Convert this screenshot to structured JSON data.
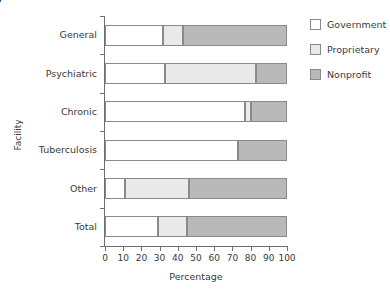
{
  "corner_fragment": {
    "line1": "7",
    "line2": ")"
  },
  "chart_data": {
    "type": "bar",
    "orientation": "horizontal",
    "stacked": true,
    "title": "",
    "xlabel": "Percentage",
    "ylabel": "Facility",
    "xlim": [
      0,
      100
    ],
    "xticks": [
      0,
      10,
      20,
      30,
      40,
      50,
      60,
      70,
      80,
      90,
      100
    ],
    "xticklabels": [
      "0",
      "10",
      "20",
      "30",
      "40",
      "50",
      "60",
      "70",
      "80",
      "90",
      "100"
    ],
    "grid": false,
    "legend_position": "right",
    "categories": [
      "General",
      "Psychiatric",
      "Chronic",
      "Tuberculosis",
      "Other",
      "Total"
    ],
    "series": [
      {
        "name": "Government",
        "color": "#ffffff",
        "values": [
          32,
          33,
          77,
          73,
          11,
          29
        ]
      },
      {
        "name": "Proprietary",
        "color": "#e9e9e9",
        "values": [
          11,
          50,
          3,
          0,
          35,
          16
        ]
      },
      {
        "name": "Nonprofit",
        "color": "#b9b9b9",
        "values": [
          57,
          17,
          20,
          27,
          54,
          55
        ]
      }
    ]
  },
  "legend": {
    "items": [
      {
        "label": "Government",
        "swatch": "sw-government"
      },
      {
        "label": "Proprietary",
        "swatch": "sw-proprietary"
      },
      {
        "label": "Nonprofit",
        "swatch": "sw-nonprofit"
      }
    ]
  }
}
